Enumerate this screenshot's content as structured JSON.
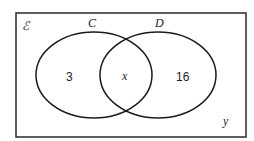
{
  "diagram": {
    "type": "venn",
    "universal_label": "ℰ",
    "sets": [
      {
        "name": "C",
        "only_value": "3"
      },
      {
        "name": "D",
        "only_value": "16"
      }
    ],
    "intersection_value": "x",
    "outside_value": "y",
    "colors": {
      "stroke": "#1a1a1a",
      "background": "#ffffff"
    }
  }
}
